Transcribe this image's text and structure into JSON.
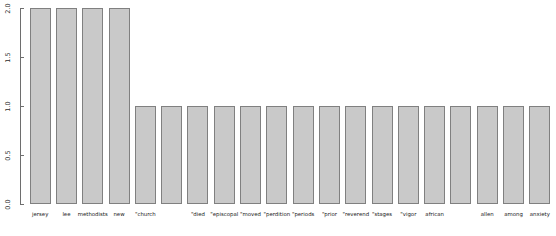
{
  "chart_data": {
    "type": "bar",
    "title": "",
    "subtitle": "",
    "xlabel": "",
    "ylabel": "",
    "ylim": [
      0.0,
      2.0
    ],
    "grid": false,
    "legend": null,
    "legend_position": "none",
    "yticks": [
      "0.0",
      "0.5",
      "1.0",
      "1.5",
      "2.0"
    ],
    "ytick_values": [
      0.0,
      0.5,
      1.0,
      1.5,
      2.0
    ],
    "categories": [
      "jersey",
      "lee",
      "methodists",
      "new",
      "church",
      "died",
      "episcopal",
      "moved",
      "perdition",
      "periods",
      "prior",
      "reverend",
      "stages",
      "vigor",
      "african",
      "allen",
      "among",
      "anxiety",
      "appointed",
      "attended"
    ],
    "values": [
      2,
      2,
      2,
      2,
      1,
      1,
      1,
      1,
      1,
      1,
      1,
      1,
      1,
      1,
      1,
      1,
      1,
      1,
      1,
      1
    ],
    "tick_labels_shown": [
      "jersey",
      "lee",
      "methodists",
      "new",
      "\"church",
      "",
      "\"died",
      "\"episcopal",
      "\"moved",
      "\"perdition",
      "\"periods",
      "\"prior",
      "\"reverend",
      "\"stages",
      "\"vigor",
      "african",
      "",
      "allen",
      "among",
      "anxiety"
    ],
    "bar_fill_color": "#c9c9c9",
    "bar_border_color": "#808080",
    "axis_color": "#6e6e6e",
    "background_color": "#ffffff"
  },
  "clipped_top_row": {
    "note": "faint cropped text row at top edge",
    "items": [
      "",
      "",
      "",
      "",
      "",
      ""
    ]
  }
}
